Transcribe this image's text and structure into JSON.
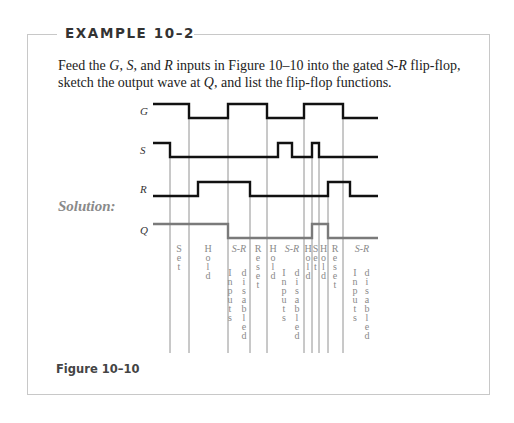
{
  "header": {
    "title": "EXAMPLE 10–2"
  },
  "problem": {
    "parts": [
      "Feed the ",
      "G",
      ", ",
      "S",
      ", and ",
      "R",
      " inputs in Figure 10–10 into the gated ",
      "S-R",
      " flip-flop,",
      "sketch the output wave at ",
      "Q",
      ", and list the flip-flop functions."
    ]
  },
  "solution": {
    "label": "Solution:"
  },
  "figure": {
    "caption": "Figure 10–10",
    "signals": [
      {
        "name": "G",
        "color": "#111111"
      },
      {
        "name": "S",
        "color": "#111111"
      },
      {
        "name": "R",
        "color": "#111111"
      },
      {
        "name": "Q",
        "color": "#7a7a7a"
      }
    ],
    "intervals": [
      {
        "label": "Set"
      },
      {
        "label": "Hold"
      },
      {
        "label": "S-R Inputs disabled"
      },
      {
        "label": "Reset"
      },
      {
        "label": "Hold"
      },
      {
        "label": "S-R Inputs disabled"
      },
      {
        "label": "Hold"
      },
      {
        "label": "Set"
      },
      {
        "label": "Hold"
      },
      {
        "label": "Reset"
      },
      {
        "label": "S-R Inputs disabled"
      }
    ]
  }
}
